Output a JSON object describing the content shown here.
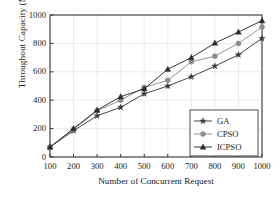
{
  "chart_data": {
    "type": "line",
    "title": "",
    "xlabel": "Number of Concurrent Request",
    "ylabel": "Throughout Capacity (Mbps)",
    "x": [
      100,
      200,
      300,
      400,
      500,
      600,
      700,
      800,
      900,
      1000
    ],
    "xticklabels": [
      "100",
      "200",
      "300",
      "400",
      "500",
      "600",
      "700",
      "800",
      "900",
      "1000"
    ],
    "yticks": [
      0,
      200,
      400,
      600,
      800,
      1000
    ],
    "yticklabels": [
      "0",
      "200",
      "400",
      "600",
      "800",
      "1000"
    ],
    "xlim": [
      100,
      1000
    ],
    "ylim": [
      0,
      1000
    ],
    "grid": true,
    "legend_position": "lower right",
    "series": [
      {
        "name": "GA",
        "marker": "star",
        "color": "#3c3c3c",
        "values": [
          70,
          185,
          290,
          350,
          445,
          500,
          565,
          640,
          720,
          835
        ]
      },
      {
        "name": "CPSO",
        "marker": "circle",
        "color": "#8c8c8c",
        "values": [
          70,
          195,
          325,
          400,
          490,
          540,
          670,
          710,
          800,
          915
        ]
      },
      {
        "name": "ICPSO",
        "marker": "triangle",
        "color": "#2b2b2b",
        "values": [
          70,
          200,
          330,
          425,
          480,
          618,
          700,
          802,
          880,
          960
        ]
      }
    ]
  },
  "legend": {
    "entries": [
      {
        "label": "GA"
      },
      {
        "label": "CPSO"
      },
      {
        "label": "ICPSO"
      }
    ]
  },
  "colors": {
    "background": "#ffffff",
    "axis": "#3a3a3a",
    "grid": "#e2e2e2",
    "text": "#1a1a1a"
  }
}
